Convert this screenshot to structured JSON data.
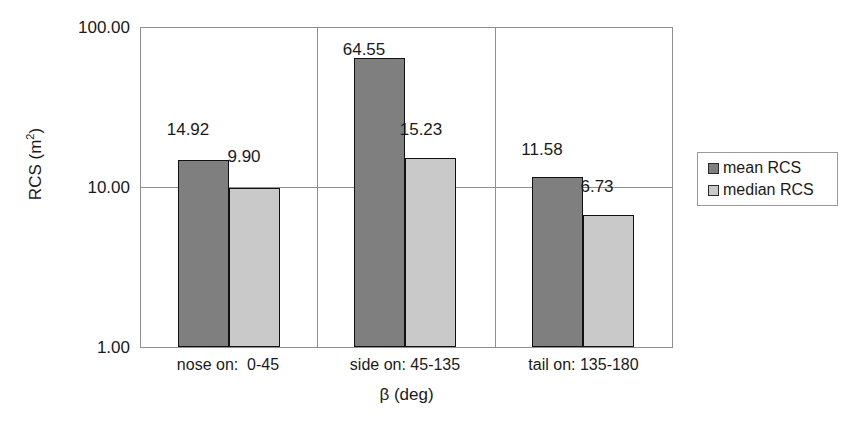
{
  "chart_data": {
    "type": "bar",
    "title": "",
    "xlabel": "β (deg)",
    "ylabel": "RCS (m²)",
    "yscale": "log",
    "ylim": [
      1.0,
      100.0
    ],
    "ytick_labels": [
      "100.00",
      "10.00",
      "1.00"
    ],
    "ytick_values": [
      100.0,
      10.0,
      1.0
    ],
    "grid": true,
    "legend_position": "right",
    "categories": [
      "nose on:  0-45",
      "side on: 45-135",
      "tail on: 135-180"
    ],
    "series": [
      {
        "name": "mean RCS",
        "color": "#7f7f7f",
        "values": [
          14.92,
          64.55,
          11.58
        ]
      },
      {
        "name": "median RCS",
        "color": "#c9c9c9",
        "values": [
          9.9,
          15.23,
          6.73
        ]
      }
    ],
    "value_labels": {
      "mean": [
        "14.92",
        "64.55",
        "11.58"
      ],
      "median": [
        "9.90",
        "15.23",
        "6.73"
      ]
    }
  },
  "axis": {
    "y_title_text": "RCS (m",
    "y_title_sup": "2",
    "y_title_close": ")",
    "x_title": "β (deg)",
    "ticks": {
      "t0": "100.00",
      "t1": "10.00",
      "t2": "1.00"
    },
    "categories": {
      "c0": "nose on:  0-45",
      "c1": "side on: 45-135",
      "c2": "tail on: 135-180"
    }
  },
  "legend": {
    "items": [
      {
        "label": "mean RCS",
        "swatch": "mean"
      },
      {
        "label": "median RCS",
        "swatch": "median"
      }
    ]
  },
  "values": {
    "g0_mean": "14.92",
    "g0_median": "9.90",
    "g1_mean": "64.55",
    "g1_median": "15.23",
    "g2_mean": "11.58",
    "g2_median": "6.73"
  }
}
